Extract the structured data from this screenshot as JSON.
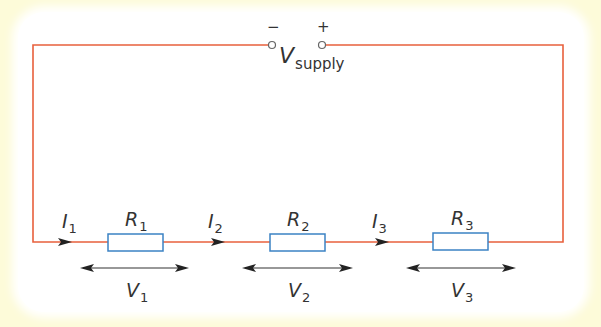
{
  "diagram": {
    "type": "series-circuit",
    "colors": {
      "background": "#fdfbd9",
      "panel": "#ffffff",
      "wire": "#e8603c",
      "resistor": "#3b82c4",
      "arrow": "#222222",
      "text": "#333333"
    },
    "supply": {
      "label": "V",
      "subscript": "supply",
      "negative": "−",
      "positive": "+"
    },
    "currents": [
      {
        "label": "I",
        "subscript": "1"
      },
      {
        "label": "I",
        "subscript": "2"
      },
      {
        "label": "I",
        "subscript": "3"
      }
    ],
    "resistors": [
      {
        "label": "R",
        "subscript": "1"
      },
      {
        "label": "R",
        "subscript": "2"
      },
      {
        "label": "R",
        "subscript": "3"
      }
    ],
    "voltages": [
      {
        "label": "V",
        "subscript": "1"
      },
      {
        "label": "V",
        "subscript": "2"
      },
      {
        "label": "V",
        "subscript": "3"
      }
    ]
  }
}
